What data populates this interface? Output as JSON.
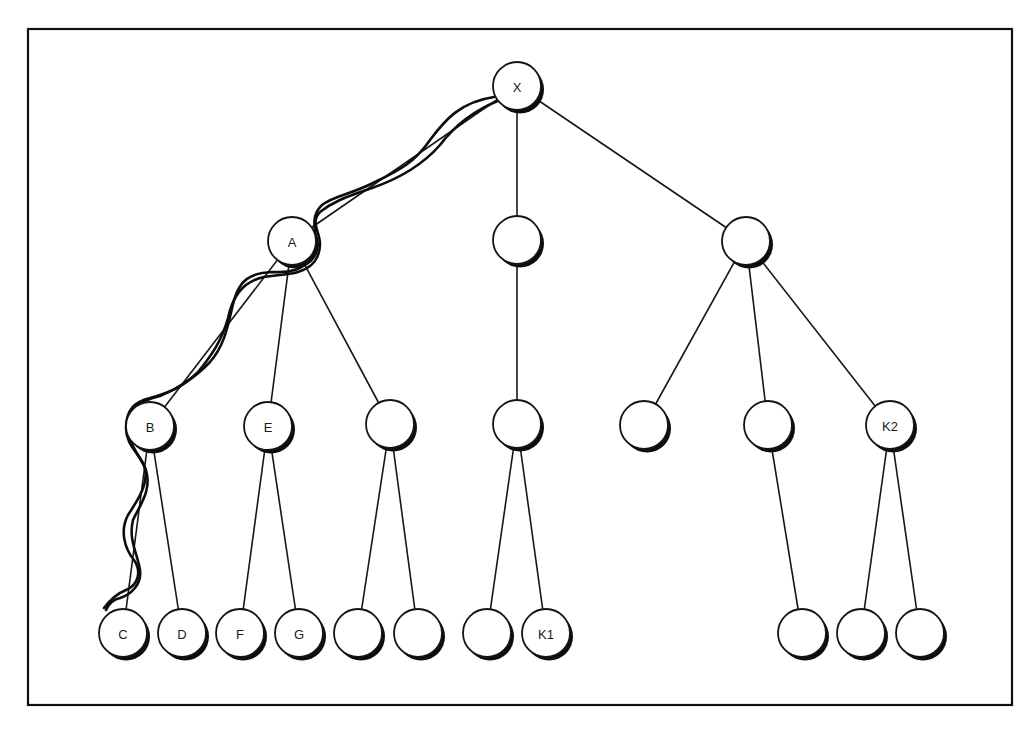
{
  "diagram": {
    "type": "tree",
    "root": "X",
    "nodes": [
      {
        "id": "X",
        "label": "X",
        "level": 0
      },
      {
        "id": "A",
        "label": "A",
        "level": 1
      },
      {
        "id": "M1",
        "label": "",
        "level": 1
      },
      {
        "id": "R1",
        "label": "",
        "level": 1
      },
      {
        "id": "B",
        "label": "B",
        "level": 2
      },
      {
        "id": "E",
        "label": "E",
        "level": 2
      },
      {
        "id": "A3",
        "label": "",
        "level": 2
      },
      {
        "id": "M2",
        "label": "",
        "level": 2
      },
      {
        "id": "R2a",
        "label": "",
        "level": 2
      },
      {
        "id": "R2b",
        "label": "",
        "level": 2
      },
      {
        "id": "K2",
        "label": "K2",
        "level": 2
      },
      {
        "id": "C",
        "label": "C",
        "level": 3
      },
      {
        "id": "D",
        "label": "D",
        "level": 3
      },
      {
        "id": "F",
        "label": "F",
        "level": 3
      },
      {
        "id": "G",
        "label": "G",
        "level": 3
      },
      {
        "id": "A3a",
        "label": "",
        "level": 3
      },
      {
        "id": "A3b",
        "label": "",
        "level": 3
      },
      {
        "id": "M3a",
        "label": "",
        "level": 3
      },
      {
        "id": "K1",
        "label": "K1",
        "level": 3
      },
      {
        "id": "R3",
        "label": "",
        "level": 3
      },
      {
        "id": "K2a",
        "label": "",
        "level": 3
      },
      {
        "id": "K2b",
        "label": "",
        "level": 3
      }
    ],
    "edges": [
      [
        "X",
        "A"
      ],
      [
        "X",
        "M1"
      ],
      [
        "X",
        "R1"
      ],
      [
        "A",
        "B"
      ],
      [
        "A",
        "E"
      ],
      [
        "A",
        "A3"
      ],
      [
        "M1",
        "M2"
      ],
      [
        "R1",
        "R2a"
      ],
      [
        "R1",
        "R2b"
      ],
      [
        "R1",
        "K2"
      ],
      [
        "B",
        "C"
      ],
      [
        "B",
        "D"
      ],
      [
        "E",
        "F"
      ],
      [
        "E",
        "G"
      ],
      [
        "A3",
        "A3a"
      ],
      [
        "A3",
        "A3b"
      ],
      [
        "M2",
        "M3a"
      ],
      [
        "M2",
        "K1"
      ],
      [
        "R2b",
        "R3"
      ],
      [
        "K2",
        "K2a"
      ],
      [
        "K2",
        "K2b"
      ]
    ],
    "traced_path": [
      "X",
      "A",
      "B",
      "C"
    ]
  }
}
